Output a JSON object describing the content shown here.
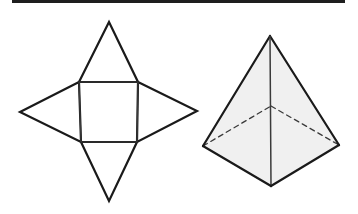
{
  "diagram": {
    "title": "",
    "colors": {
      "stroke": "#1a1a1a",
      "inner_stroke": "#3a3a3a",
      "face_fill": "#f0f0f0",
      "top_bar": "#1e1e1e",
      "background": "#ffffff"
    },
    "net": {
      "label": "Net of square pyramid",
      "square": [
        [
          79,
          82
        ],
        [
          138,
          82
        ],
        [
          137,
          142
        ],
        [
          81,
          142
        ]
      ],
      "triangles": {
        "top": [
          [
            79,
            82
          ],
          [
            109,
            22
          ],
          [
            138,
            82
          ]
        ],
        "right": [
          [
            138,
            82
          ],
          [
            197,
            111
          ],
          [
            137,
            142
          ]
        ],
        "bottom": [
          [
            81,
            142
          ],
          [
            109,
            201
          ],
          [
            137,
            142
          ]
        ],
        "left": [
          [
            79,
            82
          ],
          [
            20,
            112
          ],
          [
            81,
            142
          ]
        ]
      }
    },
    "pyramid": {
      "label": "Square pyramid",
      "apex": [
        270,
        36
      ],
      "base_left": [
        203,
        146
      ],
      "base_front": [
        271,
        186
      ],
      "base_right": [
        339,
        145
      ],
      "base_back_hidden": [
        271,
        106
      ]
    }
  }
}
